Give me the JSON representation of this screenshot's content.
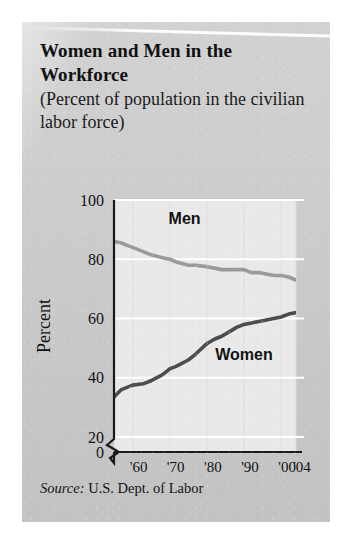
{
  "card": {
    "title": "Women and Men in the Workforce",
    "subtitle": "(Percent of population in the civilian labor force)",
    "source_label": "Source:",
    "source_value": "U.S. Dept. of Labor",
    "background_color": "#cdcdcd"
  },
  "chart_data": {
    "type": "line",
    "title": "Women and Men in the Workforce",
    "subtitle": "(Percent of population in the civilian labor force)",
    "xlabel": "Year",
    "ylabel": "Percent",
    "xlim": [
      1955,
      2004
    ],
    "ylim": [
      20,
      100
    ],
    "y_axis_break": true,
    "y_axis_break_between": [
      0,
      20
    ],
    "yticks": [
      0,
      20,
      40,
      60,
      80,
      100
    ],
    "ytick_labels": [
      "0",
      "20",
      "40",
      "60",
      "80",
      "100"
    ],
    "xticks": [
      1960,
      1970,
      1980,
      1990,
      2000,
      2004
    ],
    "xtick_labels": [
      "'60",
      "'70",
      "'80",
      "'90",
      "'00",
      "'04"
    ],
    "grid": "horizontal-white-and-faint-vertical",
    "legend": "inline-labels",
    "plot_background": "#e9e9e9",
    "series": [
      {
        "name": "Men",
        "color": "#9a9a9a",
        "label_color": "#111111",
        "x": [
          1955,
          1957,
          1960,
          1963,
          1965,
          1968,
          1970,
          1972,
          1975,
          1977,
          1980,
          1982,
          1984,
          1986,
          1988,
          1990,
          1992,
          1994,
          1996,
          1998,
          2000,
          2002,
          2004
        ],
        "values": [
          86,
          85.5,
          84,
          82.5,
          81.5,
          80.5,
          80,
          79,
          78,
          78,
          77.5,
          77,
          76.5,
          76.5,
          76.5,
          76.5,
          75.5,
          75.5,
          75,
          74.5,
          74.5,
          74,
          73
        ]
      },
      {
        "name": "Women",
        "color": "#4d4d4d",
        "label_color": "#111111",
        "x": [
          1955,
          1957,
          1960,
          1963,
          1965,
          1968,
          1970,
          1972,
          1975,
          1977,
          1980,
          1982,
          1984,
          1986,
          1988,
          1990,
          1992,
          1994,
          1996,
          1998,
          2000,
          2002,
          2004
        ],
        "values": [
          33.5,
          36,
          37.5,
          38,
          39,
          41,
          43,
          44,
          46,
          48,
          51.5,
          53,
          54,
          55.5,
          57,
          58,
          58.5,
          59,
          59.5,
          60,
          60.5,
          61.5,
          62
        ]
      }
    ],
    "annotations": [
      {
        "text": "Men",
        "x": 1974,
        "y": 92
      },
      {
        "text": "Women",
        "x": 1990,
        "y": 46
      }
    ]
  }
}
